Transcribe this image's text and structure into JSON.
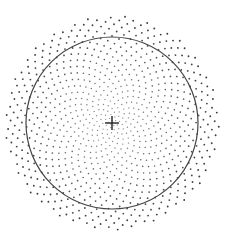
{
  "diagram": {
    "type": "point-distribution",
    "canvas": {
      "width": 229,
      "height": 245,
      "background": "#ffffff"
    },
    "center": {
      "x": 112,
      "y": 123
    },
    "boundary_circle": {
      "radius": 86,
      "stroke": "#444444",
      "stroke_width": 1.2
    },
    "crosshair": {
      "arm_length": 7,
      "stroke": "#222222",
      "stroke_width": 1.4
    },
    "points": {
      "count": 900,
      "max_radius": 107,
      "distribution": "golden-angle spiral, denser toward center",
      "density_exponent": 0.62,
      "inner_color": "#9a9a9a",
      "outer_color": "#3a3a3a",
      "inner_size": 0.9,
      "outer_size": 1.5
    }
  }
}
